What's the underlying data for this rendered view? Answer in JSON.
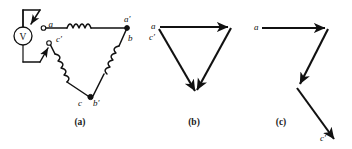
{
  "figure": {
    "background_color": "#ffffff",
    "ink_color": "#111111"
  },
  "panels": [
    {
      "id": "a",
      "caption": "(a)",
      "description": "Open-delta winding connection with voltmeter across terminals a and c-prime",
      "instrument": {
        "name": "voltmeter",
        "label": "V"
      },
      "terminals": [
        {
          "label": "a",
          "style": "open"
        },
        {
          "label": "a′",
          "style": "solid"
        },
        {
          "label": "b",
          "style": "none"
        },
        {
          "label": "b′",
          "style": "solid"
        },
        {
          "label": "c",
          "style": "none"
        },
        {
          "label": "c′",
          "style": "open"
        }
      ],
      "coils": [
        {
          "name": "coil-a-aprime",
          "turns": 4
        },
        {
          "name": "coil-b-bprime",
          "turns": 4
        },
        {
          "name": "coil-c-cprime",
          "turns": 4
        }
      ]
    },
    {
      "id": "b",
      "caption": "(b)",
      "description": "Closed phasor triangle pointing downward",
      "labels": [
        {
          "text": "a"
        },
        {
          "text": "c′"
        }
      ],
      "arrow_count": 3
    },
    {
      "id": "c",
      "caption": "(c)",
      "description": "Open phasor zigzag from a to c-prime",
      "labels": [
        {
          "text": "a"
        },
        {
          "text": "c′"
        }
      ],
      "arrow_count": 3
    }
  ]
}
